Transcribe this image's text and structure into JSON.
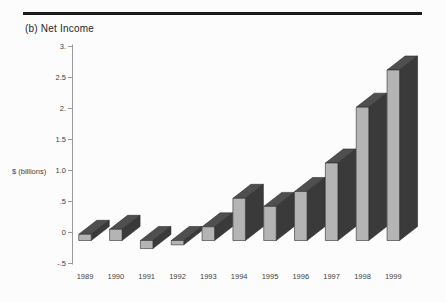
{
  "figure": {
    "panel_label": "(b)"
  },
  "chart_data": {
    "type": "bar",
    "style": "3d-oblique-columns",
    "title": "(b) Net Income",
    "ylabel": "$ (billions)",
    "xlabel": "",
    "categories": [
      "1989",
      "1990",
      "1991",
      "1992",
      "1993",
      "1994",
      "1995",
      "1996",
      "1997",
      "1998",
      "1999"
    ],
    "values": [
      0.1,
      0.18,
      -0.13,
      -0.07,
      0.22,
      0.68,
      0.55,
      0.79,
      1.25,
      2.15,
      2.75
    ],
    "ylim": [
      -0.5,
      3.0
    ],
    "yticks": [
      {
        "label": "3.",
        "value": 3.0
      },
      {
        "label": "2.5",
        "value": 2.5
      },
      {
        "label": "2.",
        "value": 2.0
      },
      {
        "label": "1.5",
        "value": 1.5
      },
      {
        "label": "1.0",
        "value": 1.0
      },
      {
        "label": ".5",
        "value": 0.5
      },
      {
        "label": "0",
        "value": 0.0
      },
      {
        "label": "-.5",
        "value": -0.5
      }
    ],
    "grid": false,
    "legend": null,
    "colors": {
      "background": "#fcfcfc",
      "bar_front": "#b4b4b4",
      "bar_top": "#4f4f4f",
      "bar_side": "#3a3a3a",
      "bar_outline": "#2e2e2e",
      "axis": "#9a9a9a",
      "tick_text": "#3f3f3f",
      "title_text": "#262626",
      "rule": "#1b1b1b"
    }
  }
}
